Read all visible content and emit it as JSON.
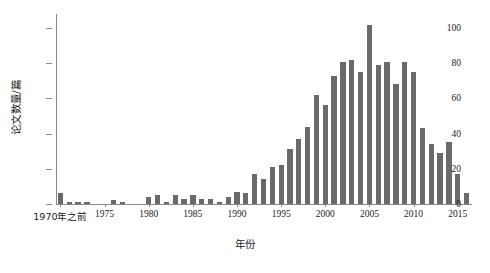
{
  "chart_data": {
    "type": "bar",
    "title": "",
    "xlabel": "年份",
    "ylabel": "论文数量/篇",
    "ylim": [
      0,
      108
    ],
    "yticks": [
      0,
      20,
      40,
      60,
      80,
      100
    ],
    "ytick_labels": [
      "0",
      "20",
      "40",
      "60",
      "80",
      "100"
    ],
    "xtick_labels": [
      "1970年之前",
      "1975",
      "1980",
      "1985",
      "1990",
      "1995",
      "2000",
      "2005",
      "2010",
      "2015"
    ],
    "grid": false,
    "legend": null,
    "bar_color": "#6a6a6a",
    "background_color": "#ffffff",
    "axis_color": "#8a8a8a",
    "categories": [
      "1970年之前",
      "1971",
      "1972",
      "1973",
      "1974",
      "1975",
      "1976",
      "1977",
      "1978",
      "1979",
      "1980",
      "1981",
      "1982",
      "1983",
      "1984",
      "1985",
      "1986",
      "1987",
      "1988",
      "1989",
      "1990",
      "1991",
      "1992",
      "1993",
      "1994",
      "1995",
      "1996",
      "1997",
      "1998",
      "1999",
      "2000",
      "2001",
      "2002",
      "2003",
      "2004",
      "2005",
      "2006",
      "2007",
      "2008",
      "2009",
      "2010",
      "2011",
      "2012",
      "2013",
      "2014",
      "2015",
      "2016"
    ],
    "values": [
      6,
      1,
      1,
      1,
      0,
      0,
      2,
      1,
      0,
      0,
      4,
      5,
      1,
      5,
      3,
      5,
      3,
      3,
      1,
      4,
      7,
      6,
      17,
      14,
      21,
      22,
      31,
      37,
      44,
      62,
      56,
      73,
      81,
      82,
      75,
      102,
      79,
      81,
      68,
      81,
      75,
      43,
      34,
      29,
      35,
      17,
      6
    ],
    "notes": {
      "peak_year": "2005",
      "peak_value": 102
    }
  }
}
